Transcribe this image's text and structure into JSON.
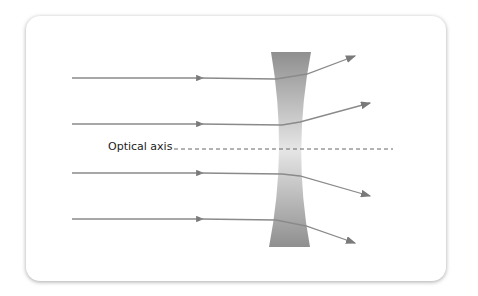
{
  "diagram": {
    "axis_label": "Optical axis",
    "colors": {
      "ray": "#8a8a8a",
      "lens_dark": "#8f8f8f",
      "lens_light": "#e6e6e6",
      "axis": "#666666"
    },
    "rays": [
      {
        "in_y": 78,
        "out_end": [
          355,
          56
        ]
      },
      {
        "in_y": 124,
        "out_end": [
          370,
          103
        ]
      },
      {
        "in_y": 173,
        "out_end": [
          370,
          196
        ]
      },
      {
        "in_y": 219,
        "out_end": [
          355,
          243
        ]
      }
    ]
  }
}
